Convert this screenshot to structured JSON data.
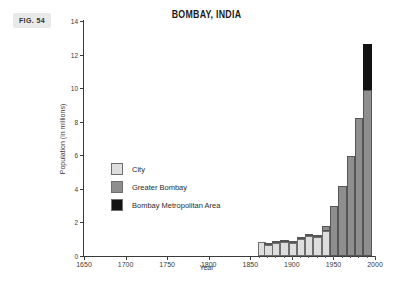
{
  "figure": {
    "tag": "FIG. 54"
  },
  "chart_data": {
    "type": "bar",
    "title": "BOMBAY, INDIA",
    "xlabel": "Year",
    "ylabel": "Population (in millions)",
    "xlim": [
      1650,
      2000
    ],
    "ylim": [
      0,
      14
    ],
    "xticks": [
      1650,
      1700,
      1750,
      1800,
      1850,
      1900,
      1950,
      2000
    ],
    "xtick_labels": [
      "1650",
      "1700",
      "1750",
      "1800",
      "1850",
      "1900",
      "1950",
      "2000"
    ],
    "yticks": [
      0,
      2,
      4,
      6,
      8,
      10,
      12,
      14
    ],
    "ytick_labels": [
      "0",
      "2",
      "4",
      "6",
      "8",
      "10",
      "12",
      "14"
    ],
    "grid": false,
    "legend_position": "inside-left",
    "stacked": true,
    "bar_width_years": 10,
    "categories": [
      1864,
      1872,
      1881,
      1891,
      1901,
      1911,
      1921,
      1931,
      1941,
      1951,
      1961,
      1971,
      1981,
      1991
    ],
    "series": [
      {
        "name": "City",
        "color": "#dedede",
        "values": [
          0.82,
          0.64,
          0.77,
          0.82,
          0.78,
          1.02,
          1.18,
          1.16,
          1.49,
          0,
          0,
          0,
          0,
          0
        ]
      },
      {
        "name": "Greater Bombay",
        "color": "#8e8e8e",
        "values": [
          0,
          0.06,
          0.06,
          0.06,
          0.07,
          0.1,
          0.09,
          0.12,
          0.28,
          2.97,
          4.15,
          5.97,
          8.24,
          9.91
        ]
      },
      {
        "name": "Bombay Metropolitan Area",
        "color": "#121212",
        "values": [
          0,
          0,
          0,
          0,
          0,
          0,
          0,
          0,
          0,
          0,
          0,
          0,
          0,
          2.71
        ]
      }
    ],
    "totals": [
      0.82,
      0.7,
      0.83,
      0.88,
      0.85,
      1.12,
      1.27,
      1.28,
      1.77,
      2.97,
      4.15,
      5.97,
      8.24,
      12.62
    ],
    "legend": [
      {
        "label": "City",
        "color": "#dedede"
      },
      {
        "label": "Greater Bombay",
        "color": "#8e8e8e"
      },
      {
        "label": "Bombay Metropolitan Area",
        "color": "#121212"
      }
    ]
  }
}
